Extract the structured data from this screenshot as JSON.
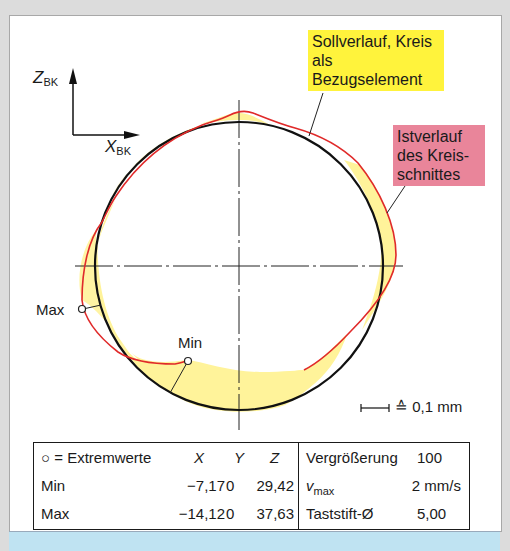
{
  "diagram": {
    "axes": {
      "z_label": "Z",
      "z_subscript": "BK",
      "x_label": "X",
      "x_subscript": "BK"
    },
    "callouts": {
      "sollverlauf": "Sollverlauf, Kreis als Bezugselement",
      "istverlauf": "Istverlauf des Kreis-schnittes"
    },
    "points": {
      "max_label": "Max",
      "min_label": "Min"
    },
    "scale": {
      "text": "≙ 0,1 mm"
    },
    "colors": {
      "reference_circle": "#111111",
      "actual_profile": "#e02a2a",
      "deviation_fill": "#fff39a",
      "sollverlauf_box": "#fff33c",
      "istverlauf_box": "#e9859a",
      "bottom_strip": "#bfe3f2"
    }
  },
  "table": {
    "header": {
      "legend": "○ = Extremwerte",
      "col_x": "X",
      "col_y": "Y",
      "col_z": "Z"
    },
    "rows": [
      {
        "label": "Min",
        "x": "−7,17",
        "y": "0",
        "z": "29,42"
      },
      {
        "label": "Max",
        "x": "−14,12",
        "y": "0",
        "z": "37,63"
      }
    ],
    "settings": [
      {
        "label": "Vergrößerung",
        "value": "100"
      },
      {
        "label": "v",
        "label_sub": "max",
        "value": "2 mm/s"
      },
      {
        "label": "Taststift-Ø",
        "value": "5,00"
      }
    ]
  }
}
